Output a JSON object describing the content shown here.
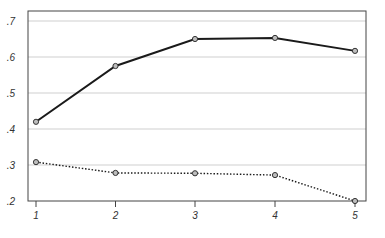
{
  "chart_data": {
    "type": "line",
    "title": "",
    "xlabel": "",
    "ylabel": "",
    "x": [
      1,
      2,
      3,
      4,
      5
    ],
    "x_tick_labels": [
      "1",
      "2",
      "3",
      "4",
      "5"
    ],
    "ylim": [
      0.2,
      0.7
    ],
    "y_ticks": [
      0.2,
      0.3,
      0.4,
      0.5,
      0.6,
      0.7
    ],
    "y_tick_labels": [
      ".2",
      ".3",
      ".4",
      ".5",
      ".6",
      ".7"
    ],
    "grid": {
      "horizontal": true,
      "vertical": false
    },
    "legend": null,
    "series": [
      {
        "name": "Series 1 (solid)",
        "style": "solid",
        "marker": "circle",
        "color": "#1a1a1a",
        "values": [
          0.42,
          0.575,
          0.65,
          0.653,
          0.617
        ]
      },
      {
        "name": "Series 2 (dotted)",
        "style": "dotted",
        "marker": "circle",
        "color": "#1a1a1a",
        "values": [
          0.308,
          0.278,
          0.277,
          0.272,
          0.2
        ]
      }
    ]
  },
  "colors": {
    "frame": "#444444",
    "grid": "#cfcfcf",
    "line": "#1a1a1a",
    "marker_fill": "#bdbdbd"
  }
}
